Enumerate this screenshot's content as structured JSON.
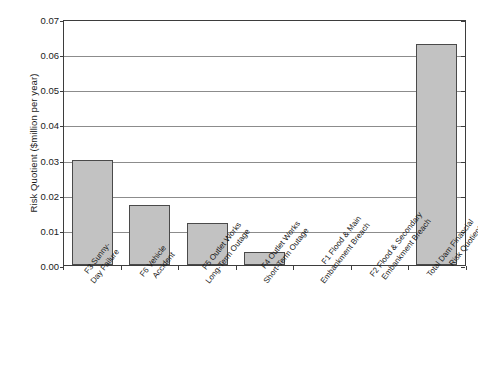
{
  "chart_data": {
    "type": "bar",
    "title": "",
    "xlabel": "",
    "ylabel": "Risk Quotient ($million per year)",
    "ylim": [
      0,
      0.07
    ],
    "ytick_labels": [
      "0.07",
      "0.06",
      "0.05",
      "0.04",
      "0.03",
      "0.02",
      "0.01",
      "0.00"
    ],
    "ytick_values": [
      0.07,
      0.06,
      0.05,
      0.04,
      0.03,
      0.02,
      0.01,
      0.0
    ],
    "grid": "horizontal",
    "legend": "none",
    "bar_color": "#c2c2c2",
    "bar_border_color": "#4a4a4a",
    "axis_color": "#3d3d3d",
    "gridline_color": "#8c8c8c",
    "categories": [
      "F3 Sunny-Day Failure",
      "F6 Vehicle Accident",
      "F5 Outlet Works Long-Term Outage",
      "F4 Outlet Works Short-Term Outage",
      "F1 Flood & Main Embankment Breach",
      "F2 Flood & Secondary Embankment Breach",
      "Total Dam Financial Risk Quotient"
    ],
    "category_lines": [
      [
        "F3 Sunny-",
        "Day Failure"
      ],
      [
        "F6 Vehicle",
        "Accident"
      ],
      [
        "F5 Outlet Works",
        "Long-Term Outage"
      ],
      [
        "F4 Outlet Works",
        "Short-Term Outage"
      ],
      [
        "F1 Flood & Main",
        "Embankment Breach"
      ],
      [
        "F2 Flood & Secondary",
        "Embankment Breach"
      ],
      [
        "Total Dam Financial",
        "Risk Quotient"
      ]
    ],
    "values": [
      0.0298,
      0.017,
      0.012,
      0.0037,
      0.0,
      0.0,
      0.0628
    ]
  }
}
